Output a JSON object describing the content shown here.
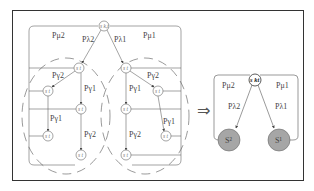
{
  "diagram": {
    "type": "graphical-model-transformation",
    "left_model": {
      "top_node": "s_{k,t}",
      "edge_labels": {
        "top_left_loop": "P_{μ2}",
        "top_right_loop": "P_{μ1}",
        "top_to_left": "P_{λ2}",
        "top_to_right": "P_{λ1}",
        "left_to_sub1": "P_{γ2}",
        "left_to_sub2": "P_{γ1}",
        "left_sub1_to_leaf": "P_{γ1}",
        "left_sub2_to_leaf": "P_{γ2}",
        "right_to_sub1": "P_{γ1}",
        "right_to_sub2": "P_{γ2}",
        "right_sub1_to_leaf": "P_{γ2}",
        "right_sub2_to_leaf": "P_{γ1}"
      },
      "left_cluster_nodes": [
        "s_t^2",
        "s_t^2",
        "s_t^2",
        "s_t^2",
        "s_t^2"
      ],
      "right_cluster_nodes": [
        "s_t^1",
        "s_t^1",
        "s_t^1",
        "s_t^1",
        "s_t^1"
      ]
    },
    "arrow": "⇒",
    "right_model": {
      "top_node": "s_{k,t}",
      "edge_labels": {
        "left_loop": "P_{μ2}",
        "right_loop": "P_{μ1}",
        "to_left": "P_{λ2}",
        "to_right": "P_{λ1}"
      },
      "left_node": "S^2",
      "right_node": "S^1"
    },
    "colors": {
      "line": "#555555",
      "gray_node_fill": "#a6a6a6",
      "frame": "#333333"
    }
  },
  "labels": {
    "pmu2": "Pμ2",
    "pmu1": "Pμ1",
    "plam2": "Pλ2",
    "plam1": "Pλ1",
    "pg2": "Pγ2",
    "pg1": "Pγ1",
    "skt": "s k,t",
    "skt_bold": "s kt",
    "st2": "s t",
    "st1": "s t",
    "S2": "S²",
    "S1": "S¹",
    "arrow": "⇒"
  }
}
